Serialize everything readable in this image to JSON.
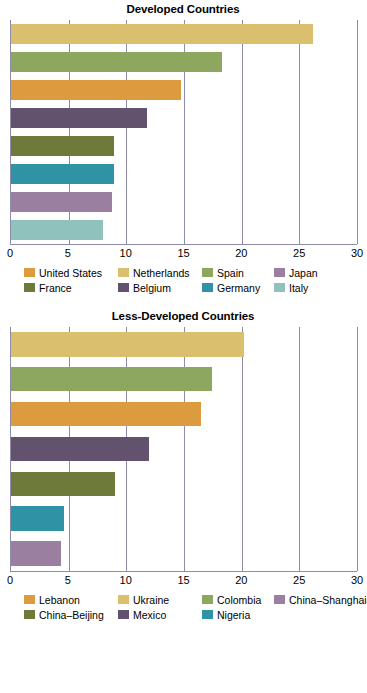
{
  "figure": {
    "background": "#ffffff",
    "axis_color": "#8d8dab",
    "text_color": "#000000"
  },
  "chart_data": [
    {
      "type": "bar",
      "orientation": "horizontal",
      "title": "Developed Countries",
      "xlabel": "",
      "ylabel": "",
      "xlim": [
        0,
        30
      ],
      "xticks": [
        0,
        5,
        10,
        15,
        20,
        25,
        30
      ],
      "xtick_labels": [
        "0",
        "5",
        "10",
        "15",
        "20",
        "25",
        "30"
      ],
      "grid": true,
      "grid_axis": "x",
      "legend_position": "bottom",
      "legend_columns": 4,
      "bar_order_labels": [
        "Netherlands",
        "Spain",
        "United States",
        "Japan",
        "France",
        "Germany",
        "Belgium",
        "Italy"
      ],
      "bar_order_values": [
        26.2,
        18.3,
        14.7,
        11.8,
        8.9,
        8.9,
        8.8,
        8.0
      ],
      "bar_order_colors": [
        "#d9bf6e",
        "#8da85e",
        "#dd9b3f",
        "#63526e",
        "#6e7a3a",
        "#2f93a5",
        "#9b7fa0",
        "#8fc1bd"
      ],
      "categories": [
        "United States",
        "Netherlands",
        "Spain",
        "Japan",
        "France",
        "Belgium",
        "Germany",
        "Italy"
      ],
      "values": [
        14.7,
        26.2,
        18.3,
        11.8,
        8.9,
        8.8,
        8.9,
        8.0
      ],
      "colors": [
        "#dd9b3f",
        "#d9bf6e",
        "#8da85e",
        "#9b7fa0",
        "#6e7a3a",
        "#63526e",
        "#2f93a5",
        "#8fc1bd"
      ],
      "legend": [
        {
          "label": "United States",
          "color": "#dd9b3f"
        },
        {
          "label": "Netherlands",
          "color": "#d9bf6e"
        },
        {
          "label": "Spain",
          "color": "#8da85e"
        },
        {
          "label": "Japan",
          "color": "#9b7fa0"
        },
        {
          "label": "France",
          "color": "#6e7a3a"
        },
        {
          "label": "Belgium",
          "color": "#63526e"
        },
        {
          "label": "Germany",
          "color": "#2f93a5"
        },
        {
          "label": "Italy",
          "color": "#8fc1bd"
        }
      ]
    },
    {
      "type": "bar",
      "orientation": "horizontal",
      "title": "Less-Developed Countries",
      "xlabel": "",
      "ylabel": "",
      "xlim": [
        0,
        30
      ],
      "xticks": [
        0,
        5,
        10,
        15,
        20,
        25,
        30
      ],
      "xtick_labels": [
        "0",
        "5",
        "10",
        "15",
        "20",
        "25",
        "30"
      ],
      "grid": true,
      "grid_axis": "x",
      "legend_position": "bottom",
      "legend_columns": 4,
      "bar_order_labels": [
        "Ukraine",
        "Colombia",
        "Lebanon",
        "Mexico",
        "China–Beijing",
        "Nigeria",
        "China–Shanghai"
      ],
      "bar_order_values": [
        20.2,
        17.4,
        16.5,
        12.0,
        9.0,
        4.6,
        4.3
      ],
      "bar_order_colors": [
        "#d9bf6e",
        "#8da85e",
        "#dd9b3f",
        "#63526e",
        "#6e7a3a",
        "#2f93a5",
        "#9b7fa0"
      ],
      "categories": [
        "Lebanon",
        "Ukraine",
        "Colombia",
        "China–Shanghai",
        "China–Beijing",
        "Mexico",
        "Nigeria"
      ],
      "values": [
        16.5,
        20.2,
        17.4,
        4.3,
        9.0,
        12.0,
        4.6
      ],
      "colors": [
        "#dd9b3f",
        "#d9bf6e",
        "#8da85e",
        "#9b7fa0",
        "#6e7a3a",
        "#63526e",
        "#2f93a5"
      ],
      "legend": [
        {
          "label": "Lebanon",
          "color": "#dd9b3f"
        },
        {
          "label": "Ukraine",
          "color": "#d9bf6e"
        },
        {
          "label": "Colombia",
          "color": "#8da85e"
        },
        {
          "label": "China–Shanghai",
          "color": "#9b7fa0"
        },
        {
          "label": "China–Beijing",
          "color": "#6e7a3a"
        },
        {
          "label": "Mexico",
          "color": "#63526e"
        },
        {
          "label": "Nigeria",
          "color": "#2f93a5"
        }
      ]
    }
  ]
}
